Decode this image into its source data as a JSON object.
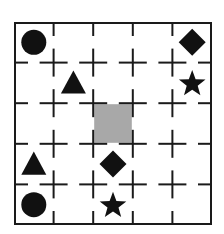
{
  "diagram": {
    "type": "grid-puzzle",
    "rows": 5,
    "cols": 5,
    "border_color": "#1a1a1a",
    "line_color": "#1a1a1a",
    "shape_color": "#111111",
    "highlight_color": "#a8a8a8",
    "highlight_cell": {
      "row": 2,
      "col": 2
    },
    "cells": [
      {
        "row": 0,
        "col": 0,
        "shape": "circle"
      },
      {
        "row": 0,
        "col": 4,
        "shape": "diamond"
      },
      {
        "row": 1,
        "col": 1,
        "shape": "triangle"
      },
      {
        "row": 1,
        "col": 4,
        "shape": "star"
      },
      {
        "row": 3,
        "col": 0,
        "shape": "triangle"
      },
      {
        "row": 3,
        "col": 2,
        "shape": "diamond"
      },
      {
        "row": 4,
        "col": 0,
        "shape": "circle"
      },
      {
        "row": 4,
        "col": 2,
        "shape": "star"
      }
    ]
  }
}
